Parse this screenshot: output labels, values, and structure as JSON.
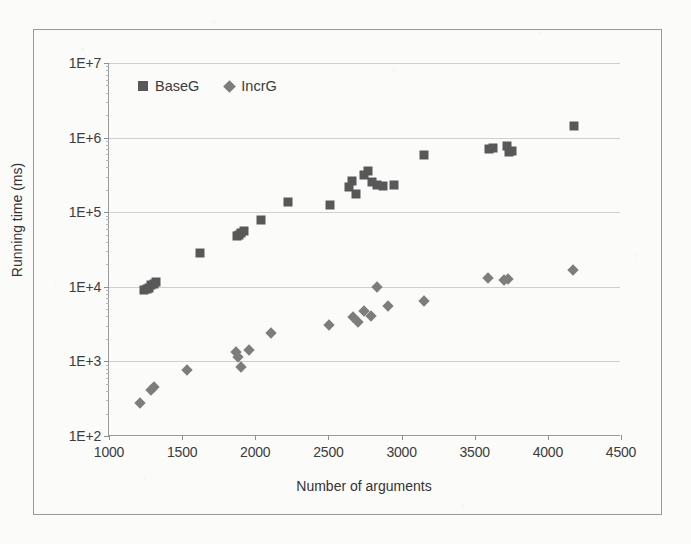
{
  "figure": {
    "background_color": "#fbfbfa",
    "frame_color": "#9b9b9b",
    "x_axis_title": "Number of arguments",
    "y_axis_title": "Running time (ms)"
  },
  "legend": {
    "position": "top-left-inside",
    "entries": [
      {
        "label": "BaseG",
        "marker": "square",
        "color": "#585858"
      },
      {
        "label": "IncrG",
        "marker": "diamond",
        "color": "#7d7d7d"
      }
    ]
  },
  "chart_data": {
    "type": "scatter",
    "title": "",
    "xlabel": "Number of arguments",
    "ylabel": "Running time (ms)",
    "xlim": [
      1000,
      4500
    ],
    "ylim": [
      100,
      10000000
    ],
    "yscale": "log",
    "xscale": "linear",
    "xticks": [
      1000,
      1500,
      2000,
      2500,
      3000,
      3500,
      4000,
      4500
    ],
    "xtick_labels": [
      "1000",
      "1500",
      "2000",
      "2500",
      "3000",
      "3500",
      "4000",
      "4500"
    ],
    "yticks": [
      100,
      1000,
      10000,
      100000,
      1000000,
      10000000
    ],
    "ytick_labels": [
      "1E+2",
      "1E+3",
      "1E+4",
      "1E+5",
      "1E+6",
      "1E+7"
    ],
    "grid": "horizontal",
    "legend_position": "upper left",
    "series": [
      {
        "name": "BaseG",
        "marker": "square",
        "color": "#585858",
        "points": [
          {
            "x": 1240,
            "y": 9000
          },
          {
            "x": 1258,
            "y": 9300
          },
          {
            "x": 1272,
            "y": 9600
          },
          {
            "x": 1290,
            "y": 10500
          },
          {
            "x": 1305,
            "y": 11000
          },
          {
            "x": 1320,
            "y": 11500
          },
          {
            "x": 1620,
            "y": 28000
          },
          {
            "x": 1875,
            "y": 48000
          },
          {
            "x": 1890,
            "y": 50000
          },
          {
            "x": 1905,
            "y": 53000
          },
          {
            "x": 1920,
            "y": 56000
          },
          {
            "x": 2040,
            "y": 78000
          },
          {
            "x": 2225,
            "y": 135000
          },
          {
            "x": 2510,
            "y": 125000
          },
          {
            "x": 2640,
            "y": 215000
          },
          {
            "x": 2660,
            "y": 265000
          },
          {
            "x": 2690,
            "y": 175000
          },
          {
            "x": 2745,
            "y": 320000
          },
          {
            "x": 2770,
            "y": 355000
          },
          {
            "x": 2800,
            "y": 255000
          },
          {
            "x": 2830,
            "y": 235000
          },
          {
            "x": 2875,
            "y": 225000
          },
          {
            "x": 2950,
            "y": 230000
          },
          {
            "x": 3150,
            "y": 580000
          },
          {
            "x": 3600,
            "y": 700000
          },
          {
            "x": 3625,
            "y": 720000
          },
          {
            "x": 3720,
            "y": 780000
          },
          {
            "x": 3735,
            "y": 640000
          },
          {
            "x": 3755,
            "y": 660000
          },
          {
            "x": 4180,
            "y": 1450000
          }
        ]
      },
      {
        "name": "IncrG",
        "marker": "diamond",
        "color": "#7d7d7d",
        "points": [
          {
            "x": 1215,
            "y": 280
          },
          {
            "x": 1285,
            "y": 410
          },
          {
            "x": 1305,
            "y": 460
          },
          {
            "x": 1530,
            "y": 760
          },
          {
            "x": 1870,
            "y": 1350
          },
          {
            "x": 1885,
            "y": 1150
          },
          {
            "x": 1900,
            "y": 840
          },
          {
            "x": 1960,
            "y": 1400
          },
          {
            "x": 2110,
            "y": 2400
          },
          {
            "x": 2505,
            "y": 3050
          },
          {
            "x": 2665,
            "y": 3900
          },
          {
            "x": 2700,
            "y": 3350
          },
          {
            "x": 2745,
            "y": 4700
          },
          {
            "x": 2790,
            "y": 4100
          },
          {
            "x": 2835,
            "y": 9800
          },
          {
            "x": 2905,
            "y": 5600
          },
          {
            "x": 3150,
            "y": 6500
          },
          {
            "x": 3590,
            "y": 13000
          },
          {
            "x": 3700,
            "y": 12500
          },
          {
            "x": 3730,
            "y": 12600
          },
          {
            "x": 4175,
            "y": 17000
          }
        ]
      }
    ]
  }
}
